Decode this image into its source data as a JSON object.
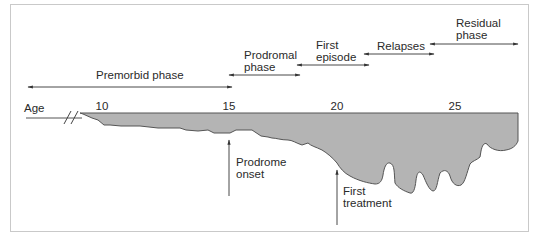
{
  "axis": {
    "label": "Age",
    "ticks": [
      {
        "value": "10",
        "x": 102
      },
      {
        "value": "15",
        "x": 229
      },
      {
        "value": "20",
        "x": 337
      },
      {
        "value": "25",
        "x": 455
      }
    ]
  },
  "phases": [
    {
      "name": "premorbid",
      "line1": "Premorbid phase",
      "line2": ""
    },
    {
      "name": "prodromal",
      "line1": "Prodromal",
      "line2": "phase"
    },
    {
      "name": "first-episode",
      "line1": "First",
      "line2": "episode"
    },
    {
      "name": "relapses",
      "line1": "Relapses",
      "line2": ""
    },
    {
      "name": "residual",
      "line1": "Residual",
      "line2": "phase"
    }
  ],
  "events": [
    {
      "name": "prodrome-onset",
      "line1": "Prodrome",
      "line2": "onset"
    },
    {
      "name": "first-treatment",
      "line1": "First",
      "line2": "treatment"
    }
  ],
  "colors": {
    "fill": "#b4b4b4",
    "stroke": "#555555",
    "line": "#333333",
    "frame": "#c9c9c9"
  }
}
